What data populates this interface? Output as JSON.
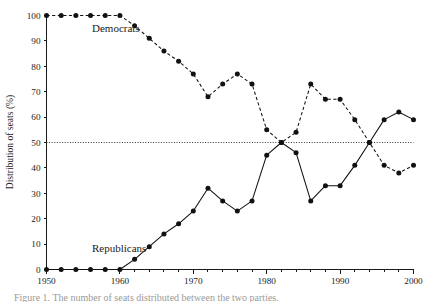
{
  "chart_data": {
    "type": "line",
    "title": "",
    "subtitle": "",
    "xlabel": "",
    "ylabel": "Distribution of seats (%)",
    "xlim": [
      1950,
      2000
    ],
    "ylim": [
      0,
      100
    ],
    "grid": false,
    "legend_position": "inline-annotation",
    "x_tick_labels": [
      "1950",
      "1960",
      "1970",
      "1980",
      "1990",
      "2000"
    ],
    "x_tick_values": [
      1950,
      1960,
      1970,
      1980,
      1990,
      2000
    ],
    "x_minor_tick_interval": 2,
    "y_tick_labels": [
      "0",
      "10",
      "20",
      "30",
      "40",
      "50",
      "60",
      "70",
      "80",
      "90",
      "100"
    ],
    "y_tick_values": [
      0,
      10,
      20,
      30,
      40,
      50,
      60,
      70,
      80,
      90,
      100
    ],
    "reference_lines": [
      {
        "name": "majority-threshold",
        "orientation": "horizontal",
        "value": 50,
        "style": "dotted"
      }
    ],
    "annotations": [
      {
        "name": "democrats-label",
        "text": "Democrats",
        "x": 1956.2,
        "y": 93.5
      },
      {
        "name": "republicans-label",
        "text": "Republicans",
        "x": 1956.2,
        "y": 7.0
      }
    ],
    "x": [
      1950,
      1952,
      1954,
      1956,
      1958,
      1960,
      1962,
      1964,
      1966,
      1968,
      1970,
      1972,
      1974,
      1976,
      1978,
      1980,
      1982,
      1984,
      1986,
      1988,
      1990,
      1992,
      1994,
      1996,
      1998,
      2000
    ],
    "series": [
      {
        "name": "Democrats",
        "line_style": "dashed",
        "marker": "filled-circle",
        "color": "#111111",
        "values": [
          100,
          100,
          100,
          100,
          100,
          100,
          96,
          91,
          86,
          82,
          77,
          68,
          73,
          77,
          73,
          55,
          50,
          54,
          73,
          67,
          67,
          59,
          50,
          41,
          38,
          41
        ]
      },
      {
        "name": "Republicans",
        "line_style": "solid",
        "marker": "filled-circle",
        "color": "#111111",
        "values": [
          0,
          0,
          0,
          0,
          0,
          0,
          4,
          9,
          14,
          18,
          23,
          32,
          27,
          23,
          27,
          45,
          50,
          46,
          27,
          33,
          33,
          41,
          50,
          59,
          62,
          59
        ]
      }
    ]
  },
  "caption": {
    "text": "Figure 1. The number of seats distributed between the two parties."
  }
}
